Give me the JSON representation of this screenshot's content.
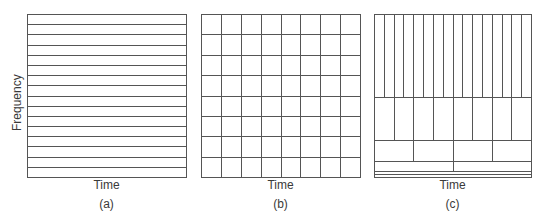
{
  "figure": {
    "y_axis_label": "Frequency",
    "panels": [
      {
        "id": "a",
        "caption": "(a)",
        "x_label": "Time",
        "tiling": "fixed frequency resolution (horizontal bands)",
        "box": {
          "left": 27,
          "top": 14,
          "right": 186,
          "bottom": 177
        },
        "horizontal_bands": 16,
        "vertical_divisions": 1
      },
      {
        "id": "b",
        "caption": "(b)",
        "x_label": "Time",
        "tiling": "uniform time-frequency grid (STFT)",
        "box": {
          "left": 201,
          "top": 14,
          "right": 360,
          "bottom": 177
        },
        "rows": 8,
        "cols": 8
      },
      {
        "id": "c",
        "caption": "(c)",
        "x_label": "Time",
        "tiling": "dyadic wavelet tiling",
        "box": {
          "left": 374,
          "top": 14,
          "right": 531,
          "bottom": 177
        },
        "levels_top_to_bottom": [
          {
            "top": 14,
            "bottom": 97,
            "cells": 16
          },
          {
            "top": 97,
            "bottom": 140,
            "cells": 8
          },
          {
            "top": 140,
            "bottom": 161,
            "cells": 4
          },
          {
            "top": 161,
            "bottom": 171,
            "cells": 2
          },
          {
            "top": 171,
            "bottom": 174,
            "cells": 1
          },
          {
            "top": 174,
            "bottom": 177,
            "cells": 1
          }
        ]
      }
    ],
    "line_color": "#555555"
  }
}
